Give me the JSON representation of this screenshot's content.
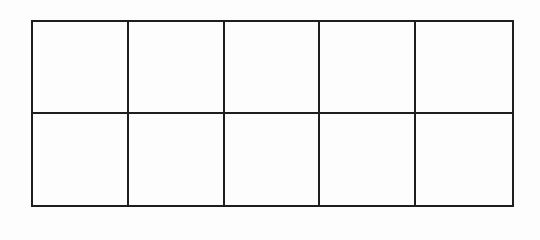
{
  "diagram": {
    "type": "ten-frame grid",
    "rows": 2,
    "columns": 5,
    "line_color": "#1e1e1e",
    "background_color": "#fdfdfd",
    "cells": [
      {
        "row": 1,
        "col": 1,
        "content": ""
      },
      {
        "row": 1,
        "col": 2,
        "content": ""
      },
      {
        "row": 1,
        "col": 3,
        "content": ""
      },
      {
        "row": 1,
        "col": 4,
        "content": ""
      },
      {
        "row": 1,
        "col": 5,
        "content": ""
      },
      {
        "row": 2,
        "col": 1,
        "content": ""
      },
      {
        "row": 2,
        "col": 2,
        "content": ""
      },
      {
        "row": 2,
        "col": 3,
        "content": ""
      },
      {
        "row": 2,
        "col": 4,
        "content": ""
      },
      {
        "row": 2,
        "col": 5,
        "content": ""
      }
    ]
  }
}
